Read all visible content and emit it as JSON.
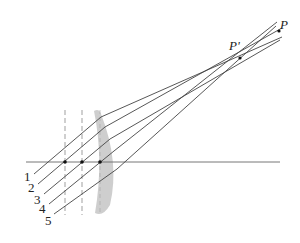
{
  "diagram": {
    "type": "optics ray diagram (spherical aberration)",
    "colors": {
      "line": "#444444",
      "lens": "#b8b8b8",
      "axis": "#666666"
    },
    "points": {
      "P": {
        "label": "P",
        "x": 279,
        "y": 31
      },
      "P_prime": {
        "label": "P'",
        "x": 240,
        "y": 58
      }
    },
    "rays": [
      {
        "label": "1",
        "start": [
          34,
          174
        ],
        "lens": [
          101,
          117
        ],
        "end": [
          282,
          37
        ]
      },
      {
        "label": "2",
        "start": [
          38,
          184
        ],
        "lens": [
          105,
          127
        ],
        "end": [
          282,
          28
        ]
      },
      {
        "label": "3",
        "start": [
          44,
          194
        ],
        "lens": [
          110,
          139
        ],
        "end": [
          280,
          40
        ]
      },
      {
        "label": "4",
        "start": [
          49,
          204
        ],
        "lens": [
          114,
          151
        ],
        "end": [
          277,
          22
        ]
      },
      {
        "label": "5",
        "start": [
          54,
          214
        ],
        "lens": [
          117,
          169
        ],
        "end": [
          276,
          26
        ]
      }
    ],
    "axis": {
      "x1": 26,
      "x2": 280,
      "y": 162
    },
    "axis_dots": [
      65,
      82,
      100
    ],
    "dashed_lines": [
      65,
      82
    ]
  }
}
